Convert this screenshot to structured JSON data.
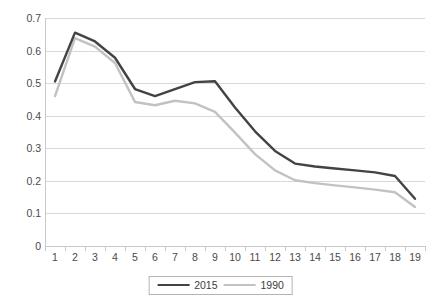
{
  "chart_data": {
    "type": "line",
    "title": "",
    "xlabel": "",
    "ylabel": "",
    "x": [
      1,
      2,
      3,
      4,
      5,
      6,
      7,
      8,
      9,
      10,
      11,
      12,
      13,
      14,
      15,
      16,
      17,
      18,
      19
    ],
    "xtick_labels": [
      "1",
      "2",
      "3",
      "4",
      "5",
      "6",
      "7",
      "8",
      "9",
      "10",
      "11",
      "12",
      "13",
      "14",
      "15",
      "16",
      "17",
      "18",
      "19"
    ],
    "ytick_labels": [
      "0",
      "0.1",
      "0.2",
      "0.3",
      "0.4",
      "0.5",
      "0.6",
      "0.7"
    ],
    "yticks": [
      0,
      0.1,
      0.2,
      0.3,
      0.4,
      0.5,
      0.6,
      0.7
    ],
    "ylim": [
      0,
      0.7
    ],
    "grid": "horizontal",
    "legend_position": "bottom-center",
    "series": [
      {
        "name": "2015",
        "color": "#434343",
        "values": [
          0.505,
          0.655,
          0.628,
          0.578,
          0.482,
          0.46,
          0.482,
          0.503,
          0.506,
          0.425,
          0.352,
          0.292,
          0.253,
          0.244,
          0.238,
          0.232,
          0.226,
          0.215,
          0.145
        ]
      },
      {
        "name": "1990",
        "color": "#c2c2c2",
        "values": [
          0.46,
          0.638,
          0.612,
          0.562,
          0.442,
          0.432,
          0.446,
          0.438,
          0.412,
          0.348,
          0.282,
          0.232,
          0.202,
          0.193,
          0.186,
          0.18,
          0.173,
          0.165,
          0.12
        ]
      }
    ]
  },
  "legend": {
    "entries": [
      {
        "label": "2015",
        "color": "#434343"
      },
      {
        "label": "1990",
        "color": "#c2c2c2"
      }
    ]
  },
  "colors": {
    "series_2015": "#434343",
    "series_1990": "#c2c2c2",
    "gridline": "#d9d9d9",
    "axis": "#c9c9c9",
    "tick_text": "#4a4a4a",
    "background": "#ffffff"
  }
}
